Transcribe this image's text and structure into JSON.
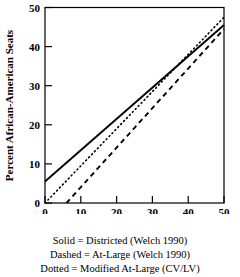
{
  "chart_data": {
    "type": "line",
    "title": "",
    "xlabel": "Percent African-American VAP",
    "ylabel": "Percent African-American Seats",
    "xlim": [
      0,
      50
    ],
    "ylim": [
      0,
      50
    ],
    "xticks": [
      0,
      10,
      20,
      30,
      40,
      50
    ],
    "yticks": [
      0,
      10,
      20,
      30,
      40,
      50
    ],
    "xtick_labels": [
      "0",
      "10",
      "20",
      "30",
      "40",
      "50"
    ],
    "ytick_labels": [
      "0",
      "10",
      "20",
      "30",
      "40",
      "50"
    ],
    "grid": false,
    "legend_position": "below-figure",
    "series": [
      {
        "name": "Solid = Districted (Welch 1990)",
        "style": "solid",
        "color": "#000000",
        "x": [
          0,
          50
        ],
        "values": [
          5.5,
          45.5
        ],
        "intercept": 5.5,
        "slope": 0.8
      },
      {
        "name": "Dashed = At-Large (Welch 1990)",
        "style": "dashed",
        "color": "#000000",
        "x": [
          6,
          50
        ],
        "values": [
          0,
          44.5
        ],
        "intercept": -5.4,
        "slope": 0.9
      },
      {
        "name": "Dotted = Modified At-Large (CV/LV)",
        "style": "dotted",
        "color": "#000000",
        "x": [
          0,
          50
        ],
        "values": [
          0,
          47.5
        ],
        "intercept": 0,
        "slope": 0.95
      }
    ]
  },
  "axes": {
    "x_title": "Percent African-American VAP",
    "y_title": "Percent African-American Seats"
  },
  "caption": {
    "lines": [
      "Solid = Districted (Welch 1990)",
      "Dashed = At-Large (Welch 1990)",
      "Dotted = Modified At-Large (CV/LV)"
    ]
  }
}
